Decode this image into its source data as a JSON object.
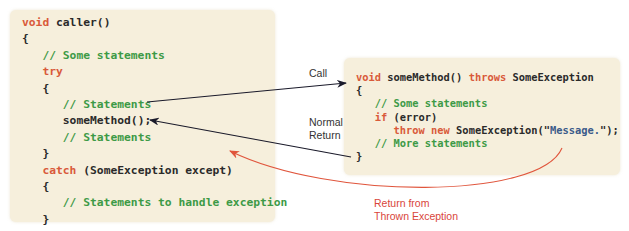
{
  "caller": {
    "lines": [
      {
        "indent": "",
        "tokens": [
          {
            "t": "void",
            "c": "kw"
          },
          {
            "t": " caller()",
            "c": ""
          }
        ]
      },
      {
        "indent": "",
        "tokens": [
          {
            "t": "{",
            "c": ""
          }
        ]
      },
      {
        "indent": "   ",
        "tokens": [
          {
            "t": "// Some statements",
            "c": "cm"
          }
        ]
      },
      {
        "indent": "   ",
        "tokens": [
          {
            "t": "try",
            "c": "kw"
          }
        ]
      },
      {
        "indent": "   ",
        "tokens": [
          {
            "t": "{",
            "c": ""
          }
        ]
      },
      {
        "indent": "      ",
        "tokens": [
          {
            "t": "// Statements",
            "c": "cm"
          }
        ]
      },
      {
        "indent": "      ",
        "tokens": [
          {
            "t": "someMethod();",
            "c": ""
          }
        ]
      },
      {
        "indent": "      ",
        "tokens": [
          {
            "t": "// Statements",
            "c": "cm"
          }
        ]
      },
      {
        "indent": "   ",
        "tokens": [
          {
            "t": "}",
            "c": ""
          }
        ]
      },
      {
        "indent": "   ",
        "tokens": [
          {
            "t": "catch",
            "c": "kw"
          },
          {
            "t": " (SomeException except)",
            "c": ""
          }
        ]
      },
      {
        "indent": "   ",
        "tokens": [
          {
            "t": "{",
            "c": ""
          }
        ]
      },
      {
        "indent": "      ",
        "tokens": [
          {
            "t": "// Statements to handle exception",
            "c": "cm"
          }
        ]
      },
      {
        "indent": "   ",
        "tokens": [
          {
            "t": "}",
            "c": ""
          }
        ]
      },
      {
        "indent": "   ",
        "tokens": [
          {
            "t": "// More statements",
            "c": "cm"
          }
        ]
      },
      {
        "indent": "",
        "tokens": [
          {
            "t": "}",
            "c": ""
          }
        ]
      }
    ]
  },
  "some_method": {
    "lines": [
      {
        "indent": "",
        "tokens": [
          {
            "t": "void",
            "c": "kw"
          },
          {
            "t": " someMethod() ",
            "c": ""
          },
          {
            "t": "throws",
            "c": "kw"
          },
          {
            "t": " SomeException",
            "c": ""
          }
        ]
      },
      {
        "indent": "",
        "tokens": [
          {
            "t": "{",
            "c": ""
          }
        ]
      },
      {
        "indent": "   ",
        "tokens": [
          {
            "t": "// Some statements",
            "c": "cm"
          }
        ]
      },
      {
        "indent": "   ",
        "tokens": [
          {
            "t": "if",
            "c": "kw"
          },
          {
            "t": " (error)",
            "c": ""
          }
        ]
      },
      {
        "indent": "      ",
        "tokens": [
          {
            "t": "throw new",
            "c": "kw"
          },
          {
            "t": " SomeException(\"",
            "c": ""
          },
          {
            "t": "Message.",
            "c": "str"
          },
          {
            "t": "\");",
            "c": ""
          }
        ]
      },
      {
        "indent": "   ",
        "tokens": [
          {
            "t": "// More statements",
            "c": "cm"
          }
        ]
      },
      {
        "indent": "",
        "tokens": [
          {
            "t": "}",
            "c": ""
          }
        ]
      }
    ]
  },
  "labels": {
    "call": "Call",
    "normal_return_1": "Normal",
    "normal_return_2": "Return",
    "thrown_1": "Return from",
    "thrown_2": "Thrown Exception"
  },
  "colors": {
    "box_bg": "#f6efdc",
    "keyword": "#d95a3a",
    "comment": "#3d9a46",
    "string": "#3b5b8a",
    "arrow_black": "#1a1a2a",
    "arrow_red": "#e0553c"
  }
}
